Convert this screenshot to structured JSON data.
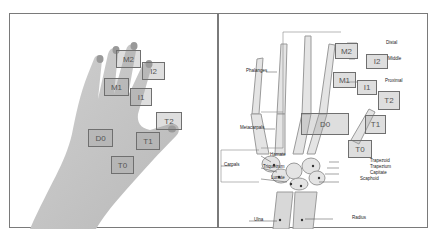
{
  "left_panel": {
    "description": "hand photo with region boxes",
    "boxes": [
      {
        "id": "M2",
        "label": "M2",
        "x": 116,
        "y": 50,
        "w": 25,
        "h": 18
      },
      {
        "id": "I2",
        "label": "I2",
        "x": 142,
        "y": 62,
        "w": 23,
        "h": 18
      },
      {
        "id": "M1",
        "label": "M1",
        "x": 104,
        "y": 78,
        "w": 25,
        "h": 18
      },
      {
        "id": "I1",
        "label": "I1",
        "x": 130,
        "y": 88,
        "w": 22,
        "h": 18
      },
      {
        "id": "T2",
        "label": "T2",
        "x": 156,
        "y": 112,
        "w": 26,
        "h": 18
      },
      {
        "id": "D0",
        "label": "D0",
        "x": 88,
        "y": 129,
        "w": 25,
        "h": 18
      },
      {
        "id": "T1",
        "label": "T1",
        "x": 136,
        "y": 132,
        "w": 24,
        "h": 18
      },
      {
        "id": "T0",
        "label": "T0",
        "x": 111,
        "y": 156,
        "w": 23,
        "h": 18
      }
    ]
  },
  "right_panel": {
    "description": "hand x-ray skeleton with anatomical labels and region boxes",
    "boxes": [
      {
        "id": "M2",
        "label": "M2",
        "x": 335,
        "y": 43,
        "w": 23,
        "h": 16
      },
      {
        "id": "I2",
        "label": "I2",
        "x": 366,
        "y": 54,
        "w": 22,
        "h": 15
      },
      {
        "id": "M1",
        "label": "M1",
        "x": 333,
        "y": 72,
        "w": 23,
        "h": 16
      },
      {
        "id": "I1",
        "label": "I1",
        "x": 357,
        "y": 80,
        "w": 20,
        "h": 15
      },
      {
        "id": "T2",
        "label": "T2",
        "x": 378,
        "y": 91,
        "w": 22,
        "h": 19
      },
      {
        "id": "D0",
        "label": "D0",
        "x": 301,
        "y": 113,
        "w": 48,
        "h": 22
      },
      {
        "id": "T1",
        "label": "T1",
        "x": 365,
        "y": 115,
        "w": 21,
        "h": 19
      },
      {
        "id": "T0",
        "label": "T0",
        "x": 348,
        "y": 140,
        "w": 24,
        "h": 18
      }
    ],
    "labels": {
      "phalanges": "Phalanges",
      "metacarpals": "Metacarpals",
      "carpals": "Carpals",
      "hamate": "Hamate",
      "triquetrum": "Triquetrum",
      "lunate": "Lunate",
      "distal": "Distal",
      "middle": "Middle",
      "proximal": "Proximal",
      "trapezoid": "Trapezoid",
      "trapezium": "Trapezium",
      "capitate": "Capitate",
      "scaphoid": "Scaphoid",
      "ulna": "Ulna",
      "radius": "Radius"
    }
  }
}
